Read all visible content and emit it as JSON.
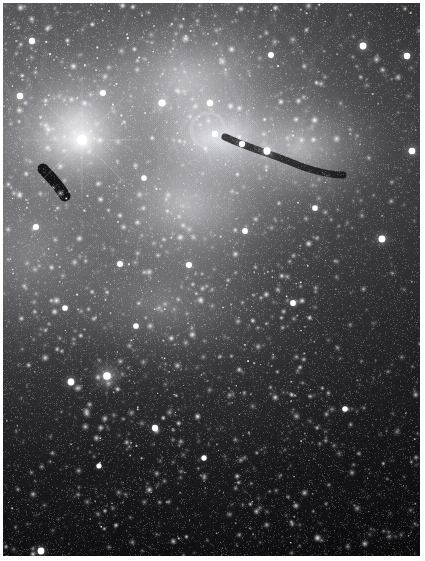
{
  "image": {
    "title": "Wide-field monochrome deep-sky photograph",
    "subject": "Emission nebula complex with dark globules in a dense Milky Way star field",
    "medium": "black-and-white photographic plate",
    "orientation": "portrait",
    "width_px": 425,
    "height_px": 561,
    "plate_margin_px": 3,
    "palette": {
      "plate_border": "#ffffff",
      "sky_background": "#07070a",
      "deep_shadow": "#000000",
      "nebula_midtone": "#8d8d92",
      "nebula_highlight": "#d9d9dd",
      "star_white": "#ffffff",
      "dark_nebula": "#101015"
    }
  },
  "chart_data": {
    "type": "scatter",
    "xlabel": "",
    "ylabel": "",
    "xlim": [
      0,
      417
    ],
    "ylim": [
      0,
      553
    ],
    "grid": false,
    "legend": null,
    "background_gradient": {
      "description": "Diffuse nebulosity and unresolved Milky Way glow brightest across the upper third, fading to near-black along the bottom and lower-right.",
      "stops": [
        {
          "y": 0,
          "brightness": 0.42
        },
        {
          "y": 60,
          "brightness": 0.5
        },
        {
          "y": 140,
          "brightness": 0.56
        },
        {
          "y": 220,
          "brightness": 0.46
        },
        {
          "y": 300,
          "brightness": 0.33
        },
        {
          "y": 380,
          "brightness": 0.22
        },
        {
          "y": 460,
          "brightness": 0.12
        },
        {
          "y": 553,
          "brightness": 0.05
        }
      ]
    },
    "nebula_patches": [
      {
        "name": "upper-left-glow",
        "cx": 70,
        "cy": 120,
        "rx": 130,
        "ry": 120,
        "brightness": 0.62,
        "feather": 0.85
      },
      {
        "name": "upper-centre-veil",
        "cx": 190,
        "cy": 90,
        "rx": 150,
        "ry": 110,
        "brightness": 0.55,
        "feather": 0.9
      },
      {
        "name": "central-bright-band",
        "cx": 180,
        "cy": 200,
        "rx": 170,
        "ry": 120,
        "brightness": 0.5,
        "feather": 0.9
      },
      {
        "name": "right-rim-glow",
        "cx": 300,
        "cy": 150,
        "rx": 110,
        "ry": 95,
        "brightness": 0.48,
        "feather": 0.9
      },
      {
        "name": "lower-centre-haze",
        "cx": 160,
        "cy": 300,
        "rx": 150,
        "ry": 110,
        "brightness": 0.3,
        "feather": 0.95
      },
      {
        "name": "left-margin-haze",
        "cx": 20,
        "cy": 250,
        "rx": 70,
        "ry": 140,
        "brightness": 0.26,
        "feather": 0.95
      },
      {
        "name": "elephant-trunk-halo",
        "cx": 215,
        "cy": 140,
        "rx": 80,
        "ry": 55,
        "brightness": 0.58,
        "feather": 0.8
      }
    ],
    "dark_nebulae": [
      {
        "name": "cometary-globule-left",
        "cx": 52,
        "cy": 178,
        "rx": 22,
        "ry": 12,
        "angle": 35,
        "opacity": 0.92
      },
      {
        "name": "trunk-head-ring",
        "cx": 205,
        "cy": 127,
        "rx": 16,
        "ry": 13,
        "angle": 0,
        "opacity": 0.55
      },
      {
        "name": "trunk-body",
        "cx": 255,
        "cy": 148,
        "rx": 34,
        "ry": 11,
        "angle": 18,
        "opacity": 0.9
      },
      {
        "name": "trunk-tail",
        "cx": 300,
        "cy": 163,
        "rx": 38,
        "ry": 8,
        "angle": 14,
        "opacity": 0.8
      },
      {
        "name": "right-dark-lane-upper",
        "cx": 382,
        "cy": 135,
        "rx": 44,
        "ry": 50,
        "angle": 0,
        "opacity": 0.95
      },
      {
        "name": "right-dark-lane-lower",
        "cx": 370,
        "cy": 290,
        "rx": 55,
        "ry": 110,
        "angle": 0,
        "opacity": 0.9
      },
      {
        "name": "top-right-dust",
        "cx": 345,
        "cy": 30,
        "rx": 70,
        "ry": 40,
        "angle": 0,
        "opacity": 0.85
      },
      {
        "name": "central-dark-pocket",
        "cx": 215,
        "cy": 210,
        "rx": 40,
        "ry": 26,
        "angle": 10,
        "opacity": 0.45
      },
      {
        "name": "lower-left-shadow",
        "cx": 30,
        "cy": 430,
        "rx": 60,
        "ry": 90,
        "angle": 0,
        "opacity": 0.6
      }
    ],
    "bright_stars": [
      {
        "id": "S1",
        "x": 79,
        "y": 137,
        "magnitude_rel": 1.0,
        "glow_radius": 52,
        "note": "dominant bright star with broad halo"
      },
      {
        "id": "S2",
        "x": 104,
        "y": 373,
        "magnitude_rel": 0.68,
        "glow_radius": 22
      },
      {
        "id": "S3",
        "x": 68,
        "y": 379,
        "magnitude_rel": 0.55,
        "glow_radius": 13
      },
      {
        "id": "S4",
        "x": 159,
        "y": 100,
        "magnitude_rel": 0.6,
        "glow_radius": 14
      },
      {
        "id": "S5",
        "x": 207,
        "y": 100,
        "magnitude_rel": 0.52,
        "glow_radius": 12
      },
      {
        "id": "S6",
        "x": 264,
        "y": 148,
        "magnitude_rel": 0.62,
        "glow_radius": 15
      },
      {
        "id": "S7",
        "x": 212,
        "y": 131,
        "magnitude_rel": 0.5,
        "glow_radius": 11
      },
      {
        "id": "S8",
        "x": 239,
        "y": 141,
        "magnitude_rel": 0.48,
        "glow_radius": 10
      },
      {
        "id": "S9",
        "x": 360,
        "y": 43,
        "magnitude_rel": 0.55,
        "glow_radius": 12
      },
      {
        "id": "S10",
        "x": 404,
        "y": 53,
        "magnitude_rel": 0.5,
        "glow_radius": 11
      },
      {
        "id": "S11",
        "x": 409,
        "y": 148,
        "magnitude_rel": 0.54,
        "glow_radius": 12
      },
      {
        "id": "S12",
        "x": 379,
        "y": 236,
        "magnitude_rel": 0.58,
        "glow_radius": 13
      },
      {
        "id": "S13",
        "x": 29,
        "y": 38,
        "magnitude_rel": 0.5,
        "glow_radius": 11
      },
      {
        "id": "S14",
        "x": 17,
        "y": 93,
        "magnitude_rel": 0.52,
        "glow_radius": 12
      },
      {
        "id": "S15",
        "x": 33,
        "y": 224,
        "magnitude_rel": 0.46,
        "glow_radius": 10
      },
      {
        "id": "S16",
        "x": 100,
        "y": 90,
        "magnitude_rel": 0.45,
        "glow_radius": 10
      },
      {
        "id": "S17",
        "x": 117,
        "y": 261,
        "magnitude_rel": 0.44,
        "glow_radius": 9
      },
      {
        "id": "S18",
        "x": 186,
        "y": 262,
        "magnitude_rel": 0.46,
        "glow_radius": 10
      },
      {
        "id": "S19",
        "x": 242,
        "y": 228,
        "magnitude_rel": 0.42,
        "glow_radius": 9
      },
      {
        "id": "S20",
        "x": 152,
        "y": 425,
        "magnitude_rel": 0.48,
        "glow_radius": 10
      },
      {
        "id": "S21",
        "x": 38,
        "y": 548,
        "magnitude_rel": 0.55,
        "glow_radius": 12
      },
      {
        "id": "S22",
        "x": 290,
        "y": 300,
        "magnitude_rel": 0.42,
        "glow_radius": 9
      },
      {
        "id": "S23",
        "x": 133,
        "y": 323,
        "magnitude_rel": 0.4,
        "glow_radius": 8
      },
      {
        "id": "S24",
        "x": 342,
        "y": 406,
        "magnitude_rel": 0.38,
        "glow_radius": 8
      },
      {
        "id": "S25",
        "x": 201,
        "y": 455,
        "magnitude_rel": 0.36,
        "glow_radius": 8
      },
      {
        "id": "S26",
        "x": 62,
        "y": 305,
        "magnitude_rel": 0.4,
        "glow_radius": 8
      },
      {
        "id": "S27",
        "x": 312,
        "y": 205,
        "magnitude_rel": 0.4,
        "glow_radius": 9
      },
      {
        "id": "S28",
        "x": 268,
        "y": 52,
        "magnitude_rel": 0.44,
        "glow_radius": 9
      },
      {
        "id": "S29",
        "x": 141,
        "y": 175,
        "magnitude_rel": 0.4,
        "glow_radius": 8
      },
      {
        "id": "S30",
        "x": 96,
        "y": 463,
        "magnitude_rel": 0.34,
        "glow_radius": 7
      }
    ],
    "star_field": {
      "description": "Several thousand unresolved faint field stars, density rising toward the upper-left and dropping in the dark dust lanes.",
      "approx_count": 5200,
      "size_range_px": [
        0.5,
        2.2
      ],
      "brightness_range": [
        0.18,
        1.0
      ]
    }
  }
}
